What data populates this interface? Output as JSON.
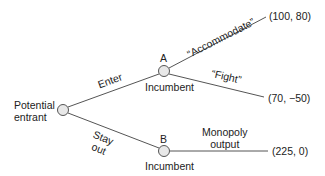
{
  "colors": {
    "line": "#555555",
    "node_fill": "#e8e8e8",
    "node_stroke": "#555555",
    "text": "#222222"
  },
  "nodes": {
    "entrant": {
      "label_line1": "Potential",
      "label_line2": "entrant"
    },
    "a": {
      "letter": "A",
      "player": "Incumbent"
    },
    "b": {
      "letter": "B",
      "player": "Incumbent"
    }
  },
  "branches": {
    "enter": "Enter",
    "stay_out_line1": "Stay",
    "stay_out_line2": "out",
    "accommodate": "“Accommodate”",
    "fight": "“Fight”",
    "monopoly_line1": "Monopoly",
    "monopoly_line2": "output"
  },
  "payoffs": {
    "accommodate": "(100, 80)",
    "fight": "(70, −50)",
    "monopoly": "(225, 0)"
  }
}
